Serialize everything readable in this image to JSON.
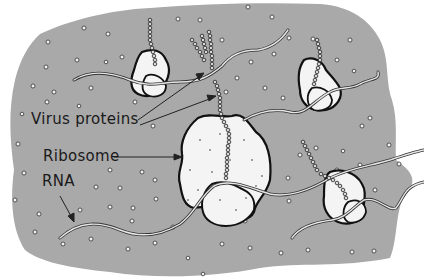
{
  "diagram": {
    "labels": {
      "virus_proteins": "Virus proteins",
      "ribosome": "Ribosome",
      "rna": "RNA"
    },
    "colors": {
      "cytoplasm": "#a9a9a9",
      "ribosome_fill": "#f4f4f4",
      "outline": "#111111",
      "rna_strand": "#e6e6e6",
      "background": "#ffffff"
    },
    "components": [
      "cytoplasm",
      "ribosome",
      "ribosome",
      "ribosome",
      "ribosome",
      "rna-strand",
      "rna-strand",
      "rna-strand",
      "protein-chain",
      "protein-chain",
      "protein-chain",
      "protein-chain"
    ]
  }
}
